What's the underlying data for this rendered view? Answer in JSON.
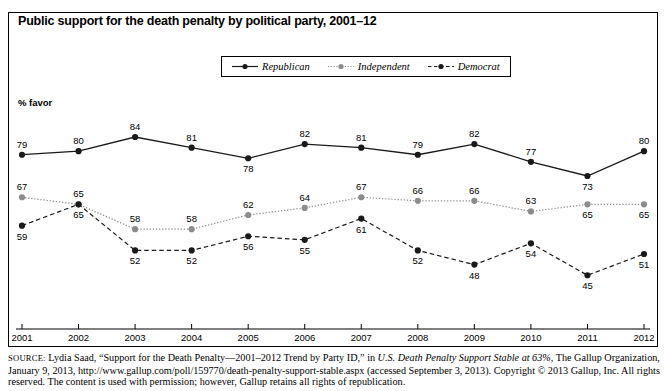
{
  "chart_data": {
    "type": "line",
    "title": "Public support for the death penalty by political party, 2001–12",
    "ylabel": "% favor",
    "xlabel": "",
    "categories": [
      "2001",
      "2002",
      "2003",
      "2004",
      "2005",
      "2006",
      "2007",
      "2008",
      "2009",
      "2010",
      "2011",
      "2012"
    ],
    "ylim": [
      40,
      90
    ],
    "grid": false,
    "legend_position": "top-center",
    "series": [
      {
        "name": "Republican",
        "style": "solid",
        "color": "#1a1a1a",
        "marker": "filled-circle",
        "values": [
          79,
          80,
          84,
          81,
          78,
          82,
          81,
          79,
          82,
          77,
          73,
          80
        ],
        "label_positions": [
          "above",
          "above",
          "above",
          "above",
          "below",
          "above",
          "above",
          "above",
          "above",
          "above",
          "below",
          "above"
        ]
      },
      {
        "name": "Independent",
        "style": "dotted",
        "color": "#8c8c8c",
        "marker": "filled-circle",
        "values": [
          67,
          65,
          58,
          58,
          62,
          64,
          67,
          66,
          66,
          63,
          65,
          65
        ],
        "label_positions": [
          "above",
          "above",
          "above",
          "above",
          "above",
          "above",
          "above",
          "above",
          "above",
          "above",
          "below",
          "below"
        ]
      },
      {
        "name": "Democrat",
        "style": "dashed",
        "color": "#1a1a1a",
        "marker": "filled-circle",
        "values": [
          59,
          65,
          52,
          52,
          56,
          55,
          61,
          52,
          48,
          54,
          45,
          51
        ],
        "label_positions": [
          "below",
          "below",
          "below",
          "below",
          "below",
          "below",
          "below",
          "below",
          "below",
          "below",
          "below",
          "below"
        ]
      }
    ]
  },
  "legend": {
    "items": [
      {
        "label": "Republican",
        "swatch": "solid-line-dot-swatch"
      },
      {
        "label": "Independent",
        "swatch": "dotted-line-dot-swatch"
      },
      {
        "label": "Democrat",
        "swatch": "dashed-line-dot-swatch"
      }
    ]
  },
  "source": {
    "label": "SOURCE:",
    "line1_a": " Lydia Saad, “Support for the Death Penalty—2001–2012 Trend by Party ID,” in ",
    "line1_italic": "U.S. Death Penalty Support Stable at 63%",
    "line1_b": ", The Gallup Organization, January 9, 2013, http://www.gallup.com/poll/159770/death-penalty-support-stable.aspx (accessed September 3, 2013). Copyright © 2013 Gallup, Inc. All rights reserved. The content is used with permission; however, Gallup retains all rights of republication."
  }
}
